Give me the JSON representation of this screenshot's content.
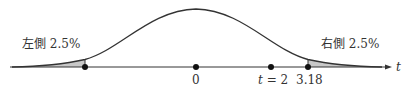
{
  "diagram": {
    "type": "t-distribution-two-tailed",
    "colors": {
      "curve": "#333333",
      "axis": "#333333",
      "tail_fill": "#c8c8c8",
      "points": "#111111",
      "text": "#333333"
    },
    "labels": {
      "left_tail": "左側 2.5%",
      "right_tail": "右側 2.5%",
      "axis_var": "t"
    },
    "points": [
      {
        "name": "left-critical",
        "label": ""
      },
      {
        "name": "center",
        "label": "0"
      },
      {
        "name": "observed",
        "label_var": "t",
        "label_rest": " = 2"
      },
      {
        "name": "right-critical",
        "label": "3.18"
      }
    ]
  }
}
